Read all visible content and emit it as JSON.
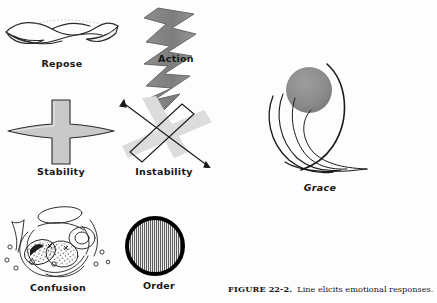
{
  "figure": {
    "caption_prefix": "FIGURE",
    "caption_number": "22-2.",
    "caption_text": "Line elicits emotional responses.",
    "background_color": "#ffffff",
    "ink_color": "#161616",
    "gray_fill": "#8a8a8a",
    "light_gray_fill": "#d8d8d8"
  },
  "panels": [
    {
      "id": "repose",
      "label": "Repose",
      "icon": "horizontal-wave-shape",
      "description": "Long horizontal leaf-like wavy line",
      "fill": "#ffffff",
      "stroke": "#2a2a2a"
    },
    {
      "id": "action",
      "label": "Action",
      "icon": "vertical-zigzag-shape",
      "description": "Vertical jagged lightning zigzag band",
      "fill": "#8a8a8a",
      "stroke": "#4a4a4a"
    },
    {
      "id": "stability",
      "label": "Stability",
      "icon": "cross-shape",
      "description": "Upright cross with tapered horizontal arms",
      "fill": "#c9c9c9",
      "stroke": "#2a2a2a"
    },
    {
      "id": "instability",
      "label": "Instability",
      "icon": "tilted-x-shape",
      "description": "Pale gray X overlapped by thin outlined tilted X",
      "fill": "#dadada",
      "stroke": "#1a1a1a"
    },
    {
      "id": "confusion",
      "label": "Confusion",
      "icon": "tangled-scribble-shape",
      "description": "Tangled loops, ellipses and stippled blobs",
      "fill": "#ffffff",
      "stroke": "#1e1e1e"
    },
    {
      "id": "order",
      "label": "Order",
      "icon": "striped-circle-shape",
      "description": "Thick black circle filled with fine vertical stripes",
      "fill": "#9a9a9a",
      "stroke": "#000000"
    },
    {
      "id": "grace",
      "label": "Grace",
      "icon": "swooping-curves-shape",
      "description": "Sweeping curved strokes beneath a gray sphere",
      "fill": "#8a8a8a",
      "stroke": "#1a1a1a"
    }
  ]
}
